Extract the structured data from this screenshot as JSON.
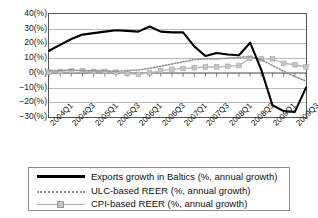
{
  "chart_data": {
    "type": "line",
    "title": "",
    "subtitle": "",
    "xlabel": "",
    "ylabel": "",
    "ylim": [
      -30,
      40
    ],
    "y_unit": "(%)",
    "grid": true,
    "legend_position": "bottom",
    "y_ticks": [
      40,
      30,
      20,
      10,
      0,
      -10,
      -20,
      -30
    ],
    "y_tick_labels": [
      "40(%)",
      "30(%)",
      "20(%)",
      "10(%)",
      "0(%)",
      "−10(%)",
      "−20(%)",
      "−30(%)"
    ],
    "x": [
      "2004Q1",
      "2004Q2",
      "2004Q3",
      "2004Q4",
      "2005Q1",
      "2005Q2",
      "2005Q3",
      "2005Q4",
      "2006Q1",
      "2006Q2",
      "2006Q3",
      "2006Q4",
      "2007Q1",
      "2007Q2",
      "2007Q3",
      "2007Q4",
      "2008Q1",
      "2008Q2",
      "2008Q3",
      "2008Q4",
      "2009Q1",
      "2009Q2",
      "2009Q3",
      "2009Q4"
    ],
    "x_tick_labels": [
      "2004Q1",
      "2004Q3",
      "2005Q1",
      "2005Q3",
      "2006Q1",
      "2006Q3",
      "2007Q1",
      "2007Q3",
      "2008Q1",
      "2008Q3",
      "2009Q1",
      "2009Q3"
    ],
    "x_tick_indices": [
      0,
      2,
      4,
      6,
      8,
      10,
      12,
      14,
      16,
      18,
      20,
      22
    ],
    "series": [
      {
        "name": "Exports growth in Baltics (%, annual growth)",
        "style": "solid-thick",
        "color": "#000000",
        "values": [
          15,
          19,
          23,
          26,
          27,
          28,
          29,
          28.5,
          28,
          31.5,
          28,
          27.5,
          27.5,
          18,
          11.5,
          13.5,
          12.5,
          12,
          13,
          17,
          20.5,
          19,
          19.5,
          20.5
        ]
      },
      {
        "name": "ULC-based REER (%, annual growth)",
        "style": "dotted",
        "color": "#8f8f8f",
        "values": [
          1.5,
          1.5,
          2,
          1.5,
          1.5,
          1.5,
          1,
          1.5,
          2,
          3,
          4.5,
          6,
          7.5,
          9,
          9.5,
          9.5,
          10,
          10.5,
          11,
          12,
          14.5,
          13.5,
          12,
          11
        ]
      },
      {
        "name": "CPI-based REER (%, annual growth)",
        "style": "marker-square",
        "color": "#bdbdbd",
        "values": [
          0.5,
          1,
          1.5,
          1.5,
          1,
          1,
          0.5,
          -0.5,
          -1,
          0,
          1.5,
          2.5,
          3,
          3.5,
          4,
          4,
          4.5,
          5,
          5,
          6.5,
          8,
          9.5,
          10.5,
          10
        ]
      }
    ],
    "series_tail": {
      "exports_crash": [
        20.5,
        2,
        -22,
        -26,
        -26.5,
        -10
      ],
      "ulc_tail": [
        11,
        9,
        5,
        1,
        -2.5,
        -5.5
      ],
      "cpi_tail": [
        10,
        9.5,
        9.5,
        6.5,
        5.5,
        4
      ]
    }
  },
  "legend": {
    "items": [
      {
        "label": "Exports growth in Baltics (%, annual growth)",
        "key": "solid-line-key"
      },
      {
        "label": "ULC-based REER (%, annual growth)",
        "key": "dotted-line-key"
      },
      {
        "label": "CPI-based REER (%, annual growth)",
        "key": "square-marker-line-key"
      }
    ]
  }
}
